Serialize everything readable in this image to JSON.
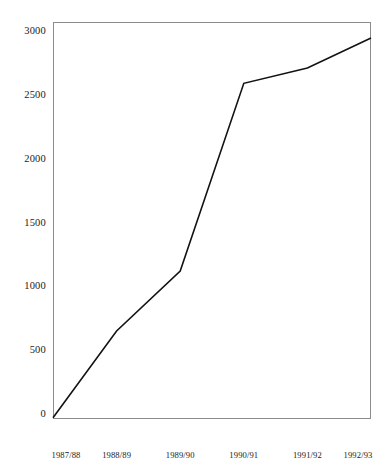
{
  "chart_data": {
    "type": "line",
    "title": "",
    "subtitle": "",
    "xlabel": "",
    "ylabel": "",
    "categories": [
      "1987/88",
      "1988/89",
      "1989/90",
      "1990/91",
      "1991/92",
      "1992/93"
    ],
    "series": [
      {
        "name": "",
        "values": [
          -30,
          650,
          1120,
          2590,
          2710,
          2945
        ]
      }
    ],
    "ylim": [
      0,
      3000
    ],
    "yticks": [
      0,
      500,
      1000,
      1500,
      2000,
      2500,
      3000
    ],
    "ytick_labels": [
      "0",
      "500",
      "1000",
      "1500",
      "2000",
      "2500",
      "3000"
    ],
    "grid": false,
    "legend": "none",
    "line_color": "#121212",
    "frame_color": "#8c8c8c",
    "background_color": "#ffffff"
  },
  "axes": {
    "y_axis_name": "value-axis",
    "x_axis_name": "period-axis"
  }
}
